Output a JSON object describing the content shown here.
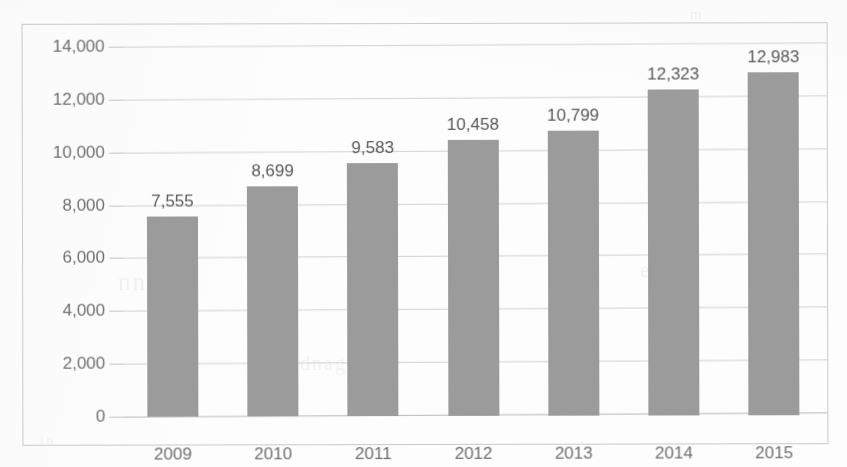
{
  "chart_data": {
    "type": "bar",
    "title": "",
    "subtitle": "",
    "xlabel": "",
    "ylabel": "",
    "categories": [
      "2009",
      "2010",
      "2011",
      "2012",
      "2013",
      "2014",
      "2015"
    ],
    "values": [
      7555,
      8699,
      9583,
      10458,
      10799,
      12323,
      12983
    ],
    "data_labels": [
      "7,555",
      "8,699",
      "9,583",
      "10,458",
      "10,799",
      "12,323",
      "12,983"
    ],
    "series": [
      {
        "name": "",
        "values": [
          7555,
          8699,
          9583,
          10458,
          10799,
          12323,
          12983
        ]
      }
    ],
    "ylim": [
      0,
      14000
    ],
    "y_ticks": [
      0,
      2000,
      4000,
      6000,
      8000,
      10000,
      12000,
      14000
    ],
    "y_tick_labels": [
      "0",
      "2,000",
      "4,000",
      "6,000",
      "8,000",
      "10,000",
      "12,000",
      "14,000"
    ],
    "grid": true,
    "grid_axis": "y",
    "legend": false,
    "legend_position": "none",
    "bar_color": "#9b9b9b",
    "grid_color": "#d2d2d2",
    "axis_label_color": "#6f6f72",
    "data_label_color": "#58585b",
    "frame_color": "#c9c9c9",
    "background_color": "#fdfdfd"
  },
  "artifacts": {
    "show_through": [
      "nnn",
      "e b",
      "dnag",
      "e a",
      "m",
      "in",
      "e"
    ]
  }
}
